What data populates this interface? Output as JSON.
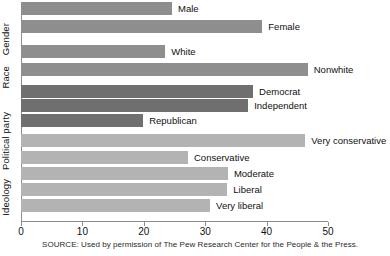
{
  "chart_data": {
    "type": "bar",
    "orientation": "horizontal",
    "title": "",
    "xlabel": "",
    "ylabel": "",
    "xlim": [
      0,
      50
    ],
    "xticks": [
      0,
      10,
      20,
      30,
      40,
      50
    ],
    "xticklabels": [
      "0",
      "10",
      "20",
      "30",
      "40",
      "50"
    ],
    "grid": false,
    "legend": false,
    "groups": [
      {
        "name": "Gender",
        "color": "#8e8e8e",
        "categories": [
          "Male",
          "Female"
        ],
        "values": [
          24.6,
          39.3
        ]
      },
      {
        "name": "Race",
        "color": "#8e8e8e",
        "categories": [
          "White",
          "Nonwhite"
        ],
        "values": [
          23.5,
          46.7
        ]
      },
      {
        "name": "Political party",
        "color": "#6f6f6f",
        "categories": [
          "Democrat",
          "Independent",
          "Republican"
        ],
        "values": [
          37.8,
          37.0,
          19.9
        ]
      },
      {
        "name": "Ideology",
        "color": "#b3b3b3",
        "categories": [
          "Very conservative",
          "Conservative",
          "Moderate",
          "Liberal",
          "Very liberal"
        ],
        "values": [
          46.3,
          27.2,
          33.7,
          33.6,
          30.8
        ]
      }
    ],
    "bars": [
      {
        "label": "Male",
        "value": 24.6,
        "group": "Gender",
        "shade": "g-demo"
      },
      {
        "label": "Female",
        "value": 39.3,
        "group": "Gender",
        "shade": "g-demo"
      },
      {
        "label": "White",
        "value": 23.5,
        "group": "Race",
        "shade": "g-demo"
      },
      {
        "label": "Nonwhite",
        "value": 46.7,
        "group": "Race",
        "shade": "g-demo"
      },
      {
        "label": "Democrat",
        "value": 37.8,
        "group": "Political party",
        "shade": "g-party"
      },
      {
        "label": "Independent",
        "value": 37.0,
        "group": "Political party",
        "shade": "g-party"
      },
      {
        "label": "Republican",
        "value": 19.9,
        "group": "Political party",
        "shade": "g-party"
      },
      {
        "label": "Very conservative",
        "value": 46.3,
        "group": "Ideology",
        "shade": "g-ideo"
      },
      {
        "label": "Conservative",
        "value": 27.2,
        "group": "Ideology",
        "shade": "g-ideo"
      },
      {
        "label": "Moderate",
        "value": 33.7,
        "group": "Ideology",
        "shade": "g-ideo"
      },
      {
        "label": "Liberal",
        "value": 33.6,
        "group": "Ideology",
        "shade": "g-ideo"
      },
      {
        "label": "Very liberal",
        "value": 30.8,
        "group": "Ideology",
        "shade": "g-ideo"
      }
    ]
  },
  "axis": {
    "group_labels": [
      "Gender",
      "Race",
      "Political party",
      "Ideology"
    ],
    "tick_labels": [
      "0",
      "10",
      "20",
      "30",
      "40",
      "50"
    ]
  },
  "source": {
    "note": "SOURCE: Used by permission of The Pew Research Center for the People & the Press."
  },
  "colors": {
    "demographic_bar": "#8e8e8e",
    "party_bar": "#6f6f6f",
    "ideology_bar": "#b3b3b3",
    "axis": "#8d8d8d",
    "text": "#111111",
    "background": "#ffffff"
  }
}
